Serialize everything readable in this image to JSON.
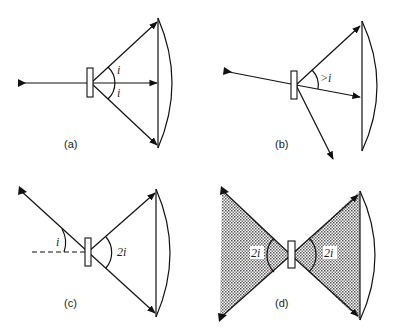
{
  "figure": {
    "panels": [
      {
        "id": "a",
        "label": "(a)",
        "angle_labels": [
          "i",
          "i"
        ]
      },
      {
        "id": "b",
        "label": "(b)",
        "angle_labels": [
          ">i"
        ]
      },
      {
        "id": "c",
        "label": "(c)",
        "angle_labels": [
          "i",
          "2i"
        ]
      },
      {
        "id": "d",
        "label": "(d)",
        "angle_labels": [
          "2i",
          "2i"
        ]
      }
    ]
  }
}
